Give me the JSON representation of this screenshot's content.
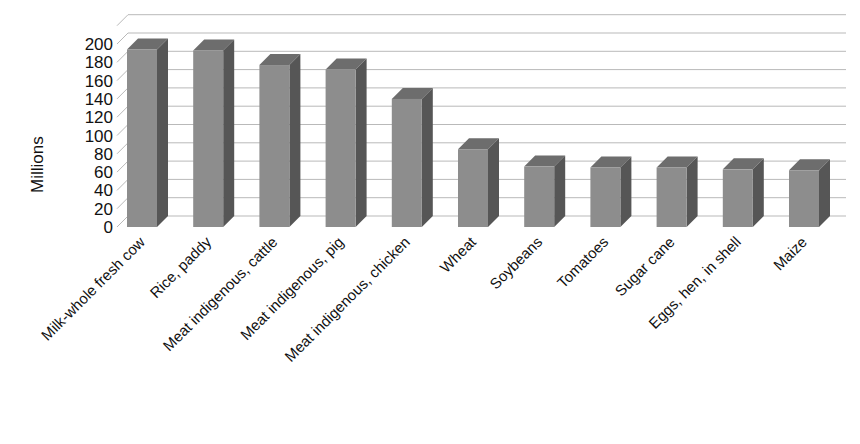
{
  "chart_data": {
    "type": "bar",
    "title": "",
    "subtitle": "",
    "xlabel": "",
    "ylabel": "Millions",
    "ylim": [
      0,
      200
    ],
    "ytick_step": 20,
    "yticks": [
      200,
      180,
      160,
      140,
      120,
      100,
      80,
      60,
      40,
      20,
      0
    ],
    "grid": true,
    "legend": "none",
    "three_d": true,
    "bar_color": "#8d8d8d",
    "bar_side_color": "#565656",
    "bar_top_color": "#6d6d6d",
    "gridline_color": "#b9b9b9",
    "categories": [
      "Milk-whole fresh cow",
      "Rice, paddy",
      "Meat indigenous, cattle",
      "Meat indigenous, pig",
      "Meat indigenous, chicken",
      "Wheat",
      "Soybeans",
      "Tomatoes",
      "Sugar cane",
      "Eggs, hen, in shell",
      "Maize"
    ],
    "values": [
      194,
      193,
      177,
      172,
      140,
      85,
      66,
      65,
      65,
      63,
      62
    ],
    "series": [
      {
        "name": "Production",
        "values": [
          194,
          193,
          177,
          172,
          140,
          85,
          66,
          65,
          65,
          63,
          62
        ]
      }
    ]
  }
}
